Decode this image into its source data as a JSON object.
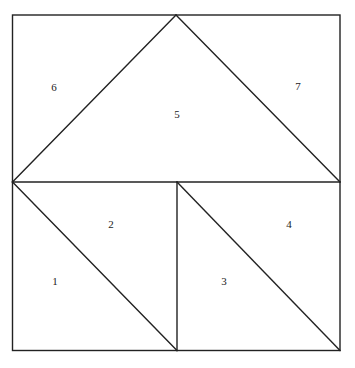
{
  "diagram": {
    "type": "square dissection into seven triangular/polygonal pieces",
    "pieces": [
      {
        "id": "1",
        "label": "1"
      },
      {
        "id": "2",
        "label": "2"
      },
      {
        "id": "3",
        "label": "3"
      },
      {
        "id": "4",
        "label": "4"
      },
      {
        "id": "5",
        "label": "5"
      },
      {
        "id": "6",
        "label": "6"
      },
      {
        "id": "7",
        "label": "7"
      }
    ],
    "line_color": "#222222",
    "background": "#ffffff"
  }
}
